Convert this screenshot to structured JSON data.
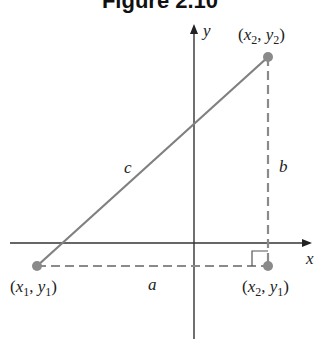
{
  "figure": {
    "title": "Figure 2.10",
    "axis_labels": {
      "x": "x",
      "y": "y"
    },
    "points": {
      "p1": {
        "label_var1": "x",
        "sub1": "1",
        "label_var2": "y",
        "sub2": "1"
      },
      "p2": {
        "label_var1": "x",
        "sub1": "2",
        "label_var2": "y",
        "sub2": "2"
      },
      "p3": {
        "label_var1": "x",
        "sub1": "2",
        "label_var2": "y",
        "sub2": "1"
      }
    },
    "sides": {
      "hypotenuse": "c",
      "vertical": "b",
      "horizontal": "a"
    },
    "colors": {
      "segment": "#808080",
      "axis": "#333333",
      "point": "#8a8a8a"
    }
  }
}
